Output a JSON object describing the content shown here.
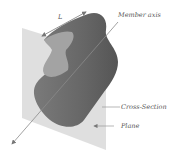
{
  "diagram": {
    "labels": {
      "length": "L",
      "member_axis": "Member axis",
      "cross_section": "Cross-Section",
      "plane": "Plane"
    },
    "colors": {
      "plane": "#d6d6d6",
      "member_body": "#6e6e6e",
      "member_dark": "#5a5a5a",
      "section_face": "#9a9a9a",
      "axis_line": "#7a7a7a",
      "leader_line": "#888888",
      "text": "#555555"
    }
  }
}
